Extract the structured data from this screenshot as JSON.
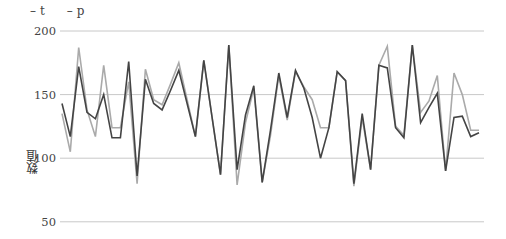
{
  "chart_data": {
    "type": "line",
    "title": "",
    "xlabel": "",
    "ylabel": "数值",
    "ylim": [
      40,
      205
    ],
    "yticks": [
      50,
      100,
      150,
      200
    ],
    "grid": {
      "horizontal": true,
      "vertical": false
    },
    "legend_position": "top-left",
    "x": [
      0,
      1,
      2,
      3,
      4,
      5,
      6,
      7,
      8,
      9,
      10,
      11,
      12,
      13,
      14,
      15,
      16,
      17,
      18,
      19,
      20,
      21,
      22,
      23,
      24,
      25,
      26,
      27,
      28,
      29,
      30,
      31,
      32,
      33,
      34,
      35,
      36,
      37,
      38,
      39,
      40,
      41,
      42,
      43,
      44,
      45,
      46,
      47,
      48,
      49,
      50
    ],
    "series": [
      {
        "name": "t",
        "color": "#444444",
        "values": [
          143,
          117,
          172,
          136,
          131,
          150,
          116,
          116,
          176,
          86,
          162,
          143,
          138,
          153,
          169,
          143,
          117,
          177,
          132,
          87,
          189,
          91,
          134,
          157,
          81,
          122,
          167,
          132,
          169,
          155,
          132,
          100,
          124,
          168,
          161,
          80,
          135,
          91,
          173,
          171,
          124,
          116,
          189,
          128,
          140,
          151,
          90,
          132,
          133,
          117,
          120
        ]
      },
      {
        "name": "p",
        "color": "#aaaaaa",
        "values": [
          135,
          105,
          187,
          138,
          117,
          173,
          124,
          124,
          160,
          80,
          170,
          146,
          142,
          158,
          175,
          146,
          117,
          177,
          132,
          87,
          189,
          79,
          128,
          155,
          81,
          118,
          165,
          130,
          168,
          156,
          146,
          124,
          124,
          168,
          161,
          78,
          132,
          91,
          173,
          188,
          125,
          118,
          189,
          136,
          145,
          165,
          90,
          167,
          150,
          122,
          122
        ]
      }
    ]
  },
  "legend": {
    "items": [
      {
        "label": "t"
      },
      {
        "label": "p"
      }
    ],
    "dash": "–"
  },
  "axis": {
    "ylabel": "数值"
  }
}
